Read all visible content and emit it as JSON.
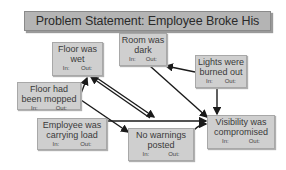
{
  "title": "Problem Statement: Employee Broke His Leg",
  "nodes": [
    {
      "id": "floor-wet",
      "label_lines": [
        "Floor was",
        "wet"
      ],
      "in_label": "In:",
      "out_label": "Out:"
    },
    {
      "id": "room-dark",
      "label_lines": [
        "Room was",
        "dark"
      ],
      "in_label": "In:",
      "out_label": "Out:"
    },
    {
      "id": "lights-burned",
      "label_lines": [
        "Lights were",
        "burned out"
      ],
      "in_label": "In:",
      "out_label": "Out:"
    },
    {
      "id": "floor-mopped",
      "label_lines": [
        "Floor had",
        "been mopped"
      ],
      "in_label": "In:",
      "out_label": "Out:"
    },
    {
      "id": "carrying-load",
      "label_lines": [
        "Employee was",
        "carrying load"
      ],
      "in_label": "In:",
      "out_label": "Out:"
    },
    {
      "id": "no-warnings",
      "label_lines": [
        "No warnings",
        "posted"
      ],
      "in_label": "In:",
      "out_label": "Out:"
    },
    {
      "id": "visibility",
      "label_lines": [
        "Visibility was",
        "compromised"
      ],
      "in_label": "In:",
      "out_label": "Out:"
    }
  ],
  "edges": [
    {
      "from": "floor-mopped",
      "to": "floor-wet"
    },
    {
      "from": "no-warnings",
      "to": "floor-wet"
    },
    {
      "from": "floor-wet",
      "to": "no-warnings"
    },
    {
      "from": "floor-mopped",
      "to": "no-warnings"
    },
    {
      "from": "lights-burned",
      "to": "room-dark"
    },
    {
      "from": "room-dark",
      "to": "visibility"
    },
    {
      "from": "lights-burned",
      "to": "visibility"
    },
    {
      "from": "carrying-load",
      "to": "visibility"
    },
    {
      "from": "no-warnings",
      "to": "visibility"
    }
  ],
  "colors": {
    "node_fill": "#cfcfcf",
    "title_fill": "#b4b4b4",
    "edge": "#1a1a1a"
  }
}
